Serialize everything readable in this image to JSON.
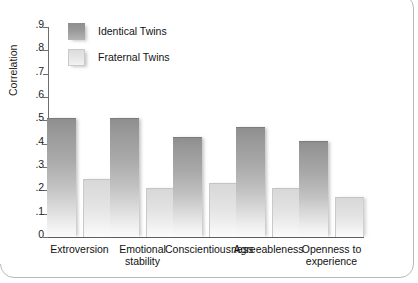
{
  "chart_data": {
    "type": "bar",
    "title": "",
    "subtitle": "",
    "xlabel": "",
    "ylabel": "Correlation",
    "ylim": [
      0,
      0.9
    ],
    "grid": false,
    "legend_position": "inside-upper-left",
    "categories": [
      "Extroversion",
      "Emotional\nstability",
      "Conscientiousness",
      "Agreeableness",
      "Openness to\nexperience"
    ],
    "ytick_labels": [
      ".9",
      ".8",
      ".7",
      ".6",
      ".5",
      ".4",
      ".3",
      ".2",
      ".1",
      "0"
    ],
    "ytick_values": [
      0.9,
      0.8,
      0.7,
      0.6,
      0.5,
      0.4,
      0.3,
      0.2,
      0.1,
      0
    ],
    "series": [
      {
        "name": "Identical Twins",
        "color": "#9a9a9a",
        "values": [
          0.51,
          0.51,
          0.43,
          0.47,
          0.41
        ]
      },
      {
        "name": "Fraternal Twins",
        "color": "#e2e2e2",
        "values": [
          0.25,
          0.21,
          0.23,
          0.21,
          0.17
        ]
      }
    ]
  },
  "legend": {
    "items": [
      {
        "label": "Identical Twins",
        "swatch": "identical"
      },
      {
        "label": "Fraternal Twins",
        "swatch": "fraternal"
      }
    ]
  },
  "axis": {
    "y_title": "Correlation"
  }
}
